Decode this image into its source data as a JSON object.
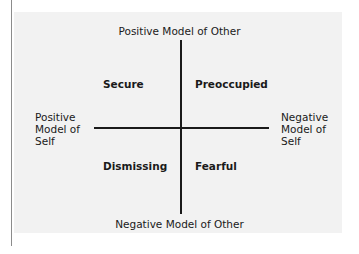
{
  "diagram": {
    "type": "quadrant",
    "axes": {
      "top": "Positive Model of Other",
      "bottom": "Negative Model of Other",
      "left": [
        "Positive",
        "Model of",
        "Self"
      ],
      "right": [
        "Negative",
        "Model of",
        "Self"
      ]
    },
    "quadrants": {
      "top_left": "Secure",
      "top_right": "Preoccupied",
      "bottom_left": "Dismissing",
      "bottom_right": "Fearful"
    },
    "colors": {
      "panel_background": "#f2f2f2",
      "axis_lines": "#1a1a1a",
      "text": "#1a1a1a",
      "left_rule": "#8c8c8c"
    }
  }
}
